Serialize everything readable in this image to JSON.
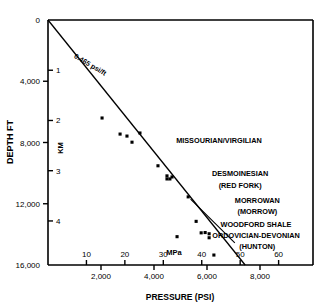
{
  "figure": {
    "title": "",
    "axis_titles": {
      "y_left": "DEPTH FT",
      "y_inner": "KM",
      "x_bottom": "PRESSURE (PSI)",
      "x_inner": "MPa"
    }
  },
  "chart_data": {
    "type": "scatter",
    "title": "",
    "xlabel": "PRESSURE (PSI)",
    "ylabel": "DEPTH FT",
    "xlim": [
      0,
      10000
    ],
    "ylim": [
      16000,
      0
    ],
    "y_inverted": true,
    "grid": false,
    "legend": null,
    "x_ticks_psi": [
      2000,
      4000,
      6000,
      8000
    ],
    "x_ticklabels_psi": [
      "2,000",
      "4,000",
      "6,000",
      "8,000"
    ],
    "x_ticks_mpa": [
      10,
      20,
      30,
      40,
      50,
      60
    ],
    "x_ticklabels_mpa": [
      "10",
      "20",
      "30",
      "40",
      "50",
      "60"
    ],
    "y_ticks_ft": [
      0,
      4000,
      8000,
      12000,
      16000
    ],
    "y_ticklabels_ft": [
      "0",
      "4,000",
      "8,000",
      "12,000",
      "16,000"
    ],
    "y_ticks_km": [
      1,
      2,
      3,
      4
    ],
    "y_ticklabels_km": [
      "1",
      "2",
      "3",
      "4"
    ],
    "series": [
      {
        "name": "hydrostatic-gradient-line",
        "type": "line",
        "label": "0.465 psi/ft",
        "points": [
          {
            "psi": 0,
            "depth_ft": 0
          },
          {
            "psi": 7440,
            "depth_ft": 16000
          }
        ]
      },
      {
        "name": "pressure-measurements",
        "type": "scatter",
        "marker": "square",
        "points": [
          {
            "psi": 2040,
            "depth_ft": 6400
          },
          {
            "psi": 2720,
            "depth_ft": 7450
          },
          {
            "psi": 2980,
            "depth_ft": 7580
          },
          {
            "psi": 3170,
            "depth_ft": 7980
          },
          {
            "psi": 3470,
            "depth_ft": 7380
          },
          {
            "psi": 4150,
            "depth_ft": 9520
          },
          {
            "psi": 4490,
            "depth_ft": 10180
          },
          {
            "psi": 4490,
            "depth_ft": 10380
          },
          {
            "psi": 4600,
            "depth_ft": 10380
          },
          {
            "psi": 4680,
            "depth_ft": 10250
          },
          {
            "psi": 5290,
            "depth_ft": 11550
          },
          {
            "psi": 5590,
            "depth_ft": 13150
          },
          {
            "psi": 5780,
            "depth_ft": 13900
          },
          {
            "psi": 5930,
            "depth_ft": 13880
          },
          {
            "psi": 6080,
            "depth_ft": 13960
          },
          {
            "psi": 6080,
            "depth_ft": 14220
          },
          {
            "psi": 4870,
            "depth_ft": 14150
          },
          {
            "psi": 6260,
            "depth_ft": 15350
          }
        ]
      }
    ],
    "annotations": [
      {
        "name": "gradient-label",
        "text": "0.465 psi/ft",
        "psi": 1550,
        "depth_ft": 3050,
        "rotated": true
      },
      {
        "name": "unit-missourian-virgilian",
        "text": "MISSOURIAN/VIRGILIAN",
        "psi": 6450,
        "depth_ft": 8050
      },
      {
        "name": "unit-desmoinesian",
        "text": "DESMOINESIAN",
        "psi": 7250,
        "depth_ft": 10200
      },
      {
        "name": "unit-desmoinesian-sub",
        "text": "(RED FORK)",
        "psi": 7250,
        "depth_ft": 10950
      },
      {
        "name": "unit-morrowan",
        "text": "MORROWAN",
        "psi": 7900,
        "depth_ft": 11950
      },
      {
        "name": "unit-morrowan-sub",
        "text": "(MORROW)",
        "psi": 7900,
        "depth_ft": 12700
      },
      {
        "name": "unit-woodford-shale",
        "text": "WOODFORD SHALE",
        "psi": 7850,
        "depth_ft": 13500
      },
      {
        "name": "unit-ordovician-devonian",
        "text": "ORDOVICIAN-DEVONIAN",
        "psi": 7850,
        "depth_ft": 14250
      },
      {
        "name": "unit-hunton-sub",
        "text": "(HUNTON)",
        "psi": 7900,
        "depth_ft": 14950
      }
    ],
    "leader_lines": [
      {
        "name": "hunton-leader",
        "from_psi": 7050,
        "from_depth_ft": 14550,
        "to_psi": 5380,
        "to_depth_ft": 11700
      }
    ]
  }
}
